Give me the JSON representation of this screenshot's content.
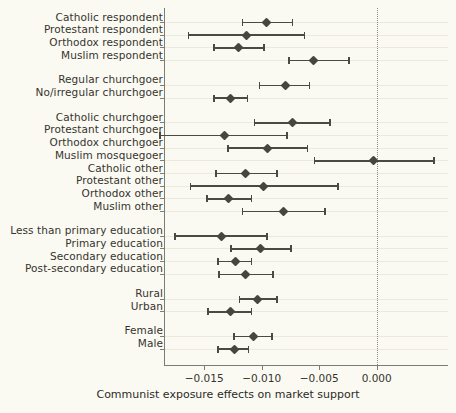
{
  "chart_data": {
    "type": "scatter",
    "title": "",
    "xlabel": "Communist exposure effects on market support",
    "ylabel": "",
    "xlim": [
      -0.0185,
      0.0062
    ],
    "xticks": [
      -0.015,
      -0.01,
      -0.005,
      0.0
    ],
    "xticklabels": [
      "−0.015",
      "−0.010",
      "−0.005",
      "0.000"
    ],
    "grid": true,
    "legend": null,
    "reference_line": 0.0,
    "orientation": "horizontal-errorbars",
    "categories": [
      "Catholic respondent",
      "Protestant respondent",
      "Orthodox respondent",
      "Muslim respondent",
      "Regular churchgoer",
      "No/irregular churchgoer",
      "Catholic churchgoer",
      "Protestant churchgoer",
      "Orthodox churchgoer",
      "Muslim mosquegoer",
      "Catholic other",
      "Protestant other",
      "Orthodox other",
      "Muslim other",
      "Less than primary education",
      "Primary education",
      "Secondary education",
      "Post-secondary education",
      "Rural",
      "Urban",
      "Female",
      "Male"
    ],
    "points": [
      {
        "label": "Catholic respondent",
        "estimate": -0.00956,
        "ci_low": -0.01168,
        "ci_high": -0.00734,
        "group": 1
      },
      {
        "label": "Protestant respondent",
        "estimate": -0.01133,
        "ci_low": -0.01637,
        "ci_high": -0.00628,
        "group": 1
      },
      {
        "label": "Orthodox respondent",
        "estimate": -0.01204,
        "ci_low": -0.01416,
        "ci_high": -0.00982,
        "group": 1
      },
      {
        "label": "Muslim respondent",
        "estimate": -0.00549,
        "ci_low": -0.00761,
        "ci_high": -0.00239,
        "group": 1
      },
      {
        "label": "Regular churchgoer",
        "estimate": -0.00796,
        "ci_low": -0.01018,
        "ci_high": -0.00584,
        "group": 2
      },
      {
        "label": "No/irregular churchgoer",
        "estimate": -0.01274,
        "ci_low": -0.01416,
        "ci_high": -0.01124,
        "group": 2
      },
      {
        "label": "Catholic churchgoer",
        "estimate": -0.00734,
        "ci_low": -0.01062,
        "ci_high": -0.00407,
        "group": 3
      },
      {
        "label": "Protestant churchgoer",
        "estimate": -0.01327,
        "ci_low": -0.01885,
        "ci_high": -0.00779,
        "group": 3
      },
      {
        "label": "Orthodox churchgoer",
        "estimate": -0.00947,
        "ci_low": -0.01292,
        "ci_high": -0.00602,
        "group": 3
      },
      {
        "label": "Muslim mosquegoer",
        "estimate": -0.00027,
        "ci_low": -0.0054,
        "ci_high": 0.00496,
        "group": 3
      },
      {
        "label": "Catholic other",
        "estimate": -0.01142,
        "ci_low": -0.01398,
        "ci_high": -0.00867,
        "group": 3
      },
      {
        "label": "Protestant other",
        "estimate": -0.00982,
        "ci_low": -0.0162,
        "ci_high": -0.00336,
        "group": 3
      },
      {
        "label": "Orthodox other",
        "estimate": -0.01292,
        "ci_low": -0.01478,
        "ci_high": -0.01088,
        "group": 3
      },
      {
        "label": "Muslim other",
        "estimate": -0.00814,
        "ci_low": -0.01168,
        "ci_high": -0.00451,
        "group": 3
      },
      {
        "label": "Less than primary education",
        "estimate": -0.01354,
        "ci_low": -0.01752,
        "ci_high": -0.00956,
        "group": 4
      },
      {
        "label": "Primary education",
        "estimate": -0.01009,
        "ci_low": -0.01265,
        "ci_high": -0.00743,
        "group": 4
      },
      {
        "label": "Secondary education",
        "estimate": -0.0123,
        "ci_low": -0.01381,
        "ci_high": -0.01088,
        "group": 4
      },
      {
        "label": "Post-secondary education",
        "estimate": -0.01142,
        "ci_low": -0.01372,
        "ci_high": -0.00903,
        "group": 4
      },
      {
        "label": "Rural",
        "estimate": -0.01035,
        "ci_low": -0.01194,
        "ci_high": -0.00867,
        "group": 5
      },
      {
        "label": "Urban",
        "estimate": -0.01274,
        "ci_low": -0.01469,
        "ci_high": -0.01088,
        "group": 5
      },
      {
        "label": "Female",
        "estimate": -0.01071,
        "ci_low": -0.01239,
        "ci_high": -0.00911,
        "group": 6
      },
      {
        "label": "Male",
        "estimate": -0.01239,
        "ci_low": -0.01381,
        "ci_high": -0.01115,
        "group": 6
      }
    ]
  },
  "colors": {
    "background": "#fbfaf2",
    "marker": "#46463f",
    "errorbar": "#4a4a44",
    "axis": "#7d7d72",
    "grid": "#eceadf",
    "zero_line": "#8c8c80",
    "text": "#2b2b28"
  }
}
